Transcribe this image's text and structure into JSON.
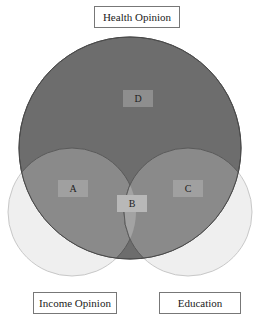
{
  "diagram": {
    "type": "venn",
    "sets": [
      {
        "name": "Health Opinion",
        "color": "#6e6e6e"
      },
      {
        "name": "Income Opinion",
        "color": "#ededed"
      },
      {
        "name": "Education",
        "color": "#ededed"
      }
    ],
    "labels": {
      "top": "Health Opinion",
      "bottom_left": "Income Opinion",
      "bottom_right": "Education"
    },
    "regions": {
      "A": "A",
      "B": "B",
      "C": "C",
      "D": "D"
    }
  }
}
